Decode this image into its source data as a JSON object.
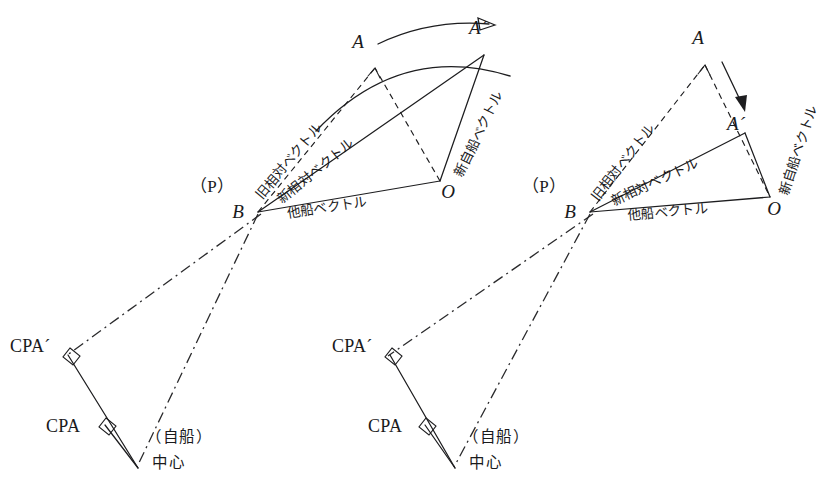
{
  "figure": {
    "background_color": "#ffffff",
    "ink_color": "#1d1d1f",
    "width": 823,
    "height": 500
  },
  "labels": {
    "point_A": "A",
    "point_A_prime": "A´",
    "point_B": "B",
    "point_O": "O",
    "point_P": "（P）",
    "cpa": "CPA",
    "cpa_prime": "CPA´",
    "own_ship_paren": "（自船）",
    "own_ship_center": "中心",
    "old_relative_vector": "旧相対ベクトル",
    "new_relative_vector": "新相対ベクトル",
    "other_ship_vector": "他船ベクトル",
    "new_own_ship_vector": "新自船ベクトル"
  },
  "panels": [
    {
      "id": "left",
      "name": "course-change-panel",
      "maneuver": "変針（コース変更）",
      "arrow_kind": "curved-arrow",
      "points": {
        "A": [
          375,
          68
        ],
        "A_prime": [
          484,
          55
        ],
        "B": [
          258,
          212
        ],
        "O": [
          440,
          181
        ],
        "CPA_prime": [
          68,
          355
        ],
        "CPA": [
          105,
          425
        ],
        "center": [
          138,
          468
        ]
      },
      "label_positions": {
        "A": [
          358,
          48
        ],
        "A_prime": [
          478,
          34
        ],
        "B": [
          238,
          218
        ],
        "O": [
          444,
          196
        ],
        "P": [
          212,
          192
        ],
        "CPA_prime": [
          10,
          349
        ],
        "CPA": [
          50,
          430
        ],
        "own_ship_paren": [
          148,
          440
        ],
        "own_ship_center": [
          152,
          466
        ],
        "old_relative_vector": {
          "x": 262,
          "y": 200,
          "rotate": -50
        },
        "new_relative_vector": {
          "x": 278,
          "y": 200,
          "rotate": -39
        },
        "other_ship_vector": {
          "x": 285,
          "y": 215,
          "rotate": -9
        },
        "new_own_ship_vector": {
          "x": 455,
          "y": 175,
          "rotate": -64
        }
      }
    },
    {
      "id": "right",
      "name": "speed-change-panel",
      "maneuver": "減速（スピード変更）",
      "arrow_kind": "straight-arrow",
      "points": {
        "A": [
          705,
          65
        ],
        "A_prime": [
          745,
          133
        ],
        "B": [
          590,
          212
        ],
        "O": [
          770,
          197
        ],
        "CPA_prime": [
          390,
          355
        ],
        "CPA": [
          425,
          425
        ],
        "center": [
          455,
          468
        ]
      },
      "label_positions": {
        "A": [
          696,
          43
        ],
        "A_prime": [
          736,
          127
        ],
        "B": [
          570,
          218
        ],
        "O": [
          765,
          213
        ],
        "P": [
          544,
          192
        ],
        "CPA_prime": [
          332,
          349
        ],
        "CPA": [
          372,
          430
        ],
        "own_ship_paren": [
          465,
          440
        ],
        "own_ship_center": [
          469,
          466
        ],
        "old_relative_vector": {
          "x": 598,
          "y": 200,
          "rotate": -52
        },
        "new_relative_vector": {
          "x": 612,
          "y": 202,
          "rotate": -25
        },
        "other_ship_vector": {
          "x": 625,
          "y": 217,
          "rotate": -5
        },
        "new_own_ship_vector": {
          "x": 780,
          "y": 192,
          "rotate": -72
        }
      }
    }
  ]
}
